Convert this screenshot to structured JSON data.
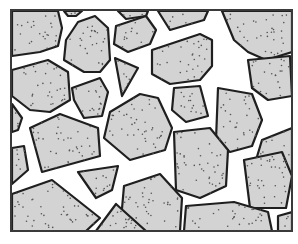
{
  "figure": {
    "title": "",
    "colors": {
      "stone_fill": "#d3d3d3",
      "stone_outline": "#1f1f1f",
      "gap": "#ffffff",
      "frame": "#3a3a3a",
      "speck": "#555555"
    },
    "frame": {
      "x": 11,
      "y": 10,
      "width": 281,
      "height": 221
    },
    "stones": [
      {
        "id": 1,
        "points": "12,11 58,11 62,28 58,46 40,52 12,56"
      },
      {
        "id": 2,
        "points": "64,11 82,11 76,16 68,16"
      },
      {
        "id": 3,
        "points": "78,22 95,16 108,28 110,60 100,72 84,72 64,60 66,40"
      },
      {
        "id": 4,
        "points": "118,11 148,11 146,16 126,19"
      },
      {
        "id": 5,
        "points": "158,11 208,11 204,20 170,30"
      },
      {
        "id": 6,
        "points": "222,11 292,11 292,52 266,60 248,52 234,40"
      },
      {
        "id": 7,
        "points": "116,26 146,16 156,30 150,44 128,52 114,44"
      },
      {
        "id": 8,
        "points": "115,58 138,68 122,96"
      },
      {
        "id": 9,
        "points": "12,70 48,60 68,72 70,100 50,112 30,110 12,96"
      },
      {
        "id": 10,
        "points": "152,50 200,34 212,40 212,66 200,80 170,84 152,74"
      },
      {
        "id": 11,
        "points": "248,60 290,56 292,96 268,100 252,88"
      },
      {
        "id": 12,
        "points": "72,88 100,78 108,92 102,116 84,118 74,100"
      },
      {
        "id": 13,
        "points": "174,88 200,86 208,116 186,122 172,110"
      },
      {
        "id": 14,
        "points": "110,112 140,94 158,98 172,128 165,150 130,160 104,138"
      },
      {
        "id": 15,
        "points": "218,88 252,94 262,120 252,146 230,152 216,140"
      },
      {
        "id": 16,
        "points": "262,140 292,128 292,172 270,178 256,160"
      },
      {
        "id": 17,
        "points": "12,104 22,118 18,130 12,132"
      },
      {
        "id": 18,
        "points": "30,128 60,114 98,128 100,156 42,172"
      },
      {
        "id": 19,
        "points": "12,148 24,146 28,170 12,184"
      },
      {
        "id": 20,
        "points": "174,132 210,128 228,150 226,186 200,198 176,190"
      },
      {
        "id": 21,
        "points": "244,160 282,152 292,176 286,208 250,208"
      },
      {
        "id": 22,
        "points": "78,172 118,166 112,190 96,198"
      },
      {
        "id": 23,
        "points": "12,194 52,180 100,218 86,231 12,231"
      },
      {
        "id": 24,
        "points": "124,186 160,174 182,198 180,231 120,231"
      },
      {
        "id": 25,
        "points": "96,231 116,204 146,231"
      },
      {
        "id": 26,
        "points": "186,206 234,202 268,212 272,231 184,231"
      },
      {
        "id": 27,
        "points": "278,216 292,212 292,231 278,231"
      }
    ]
  }
}
